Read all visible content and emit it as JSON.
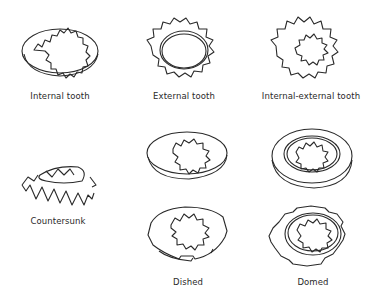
{
  "figure": {
    "washers": [
      {
        "id": "internal-tooth",
        "label": "Internal tooth"
      },
      {
        "id": "external-tooth",
        "label": "External tooth"
      },
      {
        "id": "internal-external-tooth",
        "label": "Internal-external tooth"
      },
      {
        "id": "countersunk",
        "label": "Countersunk"
      },
      {
        "id": "dished-top",
        "label": ""
      },
      {
        "id": "dished-bottom",
        "label": "Dished"
      },
      {
        "id": "domed-top",
        "label": ""
      },
      {
        "id": "domed-bottom",
        "label": "Domed"
      }
    ],
    "colors": {
      "line": "#2a2a2a",
      "background": "#ffffff"
    }
  }
}
